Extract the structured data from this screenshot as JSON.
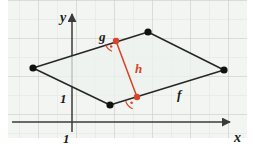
{
  "figure": {
    "canvas": {
      "width": 255,
      "height": 153
    },
    "colors": {
      "paper": "#ffffff",
      "plot_background": "#f2f5f1",
      "grid_minor": "#dfe6de",
      "grid_major": "#c6d0c5",
      "axis": "#3a3a3a",
      "shape_stroke": "#262626",
      "shape_fill": "#eef2ed",
      "vertex": "#111111",
      "accent_red": "#d8442a",
      "label_dark": "#1a1a1a"
    },
    "plot_area": {
      "x": 8,
      "y": 0,
      "width": 239,
      "height": 138
    },
    "grid": {
      "spacing": 19.0,
      "major_every": 2,
      "visible": true
    },
    "axes": {
      "origin": {
        "x": 72,
        "y": 122
      },
      "x_axis": {
        "label": "x",
        "label_x": 238,
        "label_y": 139,
        "arrow": true,
        "from_x": 12,
        "to_x": 232,
        "y": 122
      },
      "y_axis": {
        "label": "y",
        "label_x": 62,
        "label_y": 20,
        "arrow": true,
        "from_y": 132,
        "to_y": 12,
        "x": 72
      },
      "unit_ticks": [
        {
          "name": "unit-y",
          "label": "1",
          "x": 63,
          "y": 99
        },
        {
          "name": "unit-x",
          "label": "1",
          "x": 66,
          "y": 140
        }
      ]
    },
    "parallelogram": {
      "vertices": [
        {
          "name": "vertex-left",
          "x": 33,
          "y": 68
        },
        {
          "name": "vertex-top",
          "x": 148,
          "y": 32
        },
        {
          "name": "vertex-right",
          "x": 224,
          "y": 70
        },
        {
          "name": "vertex-bottom",
          "x": 110,
          "y": 105
        }
      ],
      "vertex_radius": 3.6,
      "stroke_width": 1.5
    },
    "height_segment": {
      "name": "height-h",
      "from": {
        "x": 116,
        "y": 41
      },
      "to": {
        "x": 137,
        "y": 97
      },
      "stroke_width": 1.5,
      "endpoint_radius": 3.2
    },
    "right_angle_marks": [
      {
        "name": "right-angle-upper",
        "cx": 116,
        "cy": 41,
        "radius": 11,
        "start_deg": 163,
        "end_deg": 249,
        "dot_r": 1.3,
        "dot_offset": 6.5
      },
      {
        "name": "right-angle-lower",
        "cx": 137,
        "cy": 97,
        "radius": 12,
        "start_deg": 160,
        "end_deg": 249,
        "dot_r": 1.3,
        "dot_offset": 7
      }
    ],
    "labels": [
      {
        "name": "label-g",
        "text": "g",
        "x": 99,
        "y": 41,
        "color": "#1a1a1a",
        "size": 13
      },
      {
        "name": "label-h",
        "text": "h",
        "x": 135,
        "y": 73,
        "color": "#d8442a",
        "size": 13
      },
      {
        "name": "label-f",
        "text": "f",
        "x": 177,
        "y": 99,
        "color": "#1a1a1a",
        "size": 13
      },
      {
        "name": "label-y-axis",
        "text": "y",
        "x": 62,
        "y": 22,
        "color": "#1a1a1a",
        "size": 14
      },
      {
        "name": "label-x-axis",
        "text": "x",
        "x": 236,
        "y": 141,
        "color": "#1a1a1a",
        "size": 14
      },
      {
        "name": "label-unit-y",
        "text": "1",
        "x": 62,
        "y": 102,
        "color": "#1a1a1a",
        "size": 13
      },
      {
        "name": "label-unit-x",
        "text": "1",
        "x": 65,
        "y": 142,
        "color": "#1a1a1a",
        "size": 13
      }
    ]
  }
}
